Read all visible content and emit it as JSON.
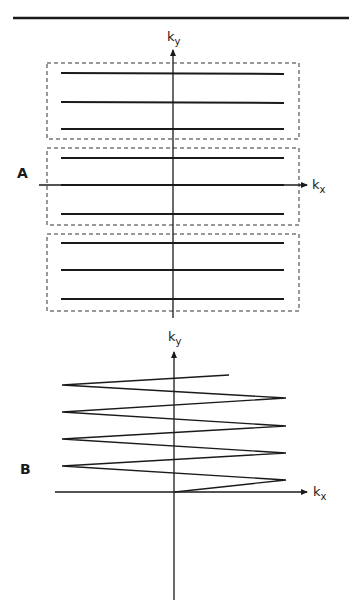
{
  "figure": {
    "top_rule": true,
    "panels": [
      {
        "id": "A",
        "label": "A",
        "x_axis_label": "k",
        "x_axis_sub": "x",
        "y_axis_label": "k",
        "y_axis_sub": "y",
        "description": "Segmented (multi-shot) EPI trajectory: three dashed boxes, each containing three horizontal k-space lines",
        "segments": 3,
        "lines_per_segment": 3
      },
      {
        "id": "B",
        "label": "B",
        "x_axis_label": "k",
        "x_axis_sub": "x",
        "y_axis_label": "k",
        "y_axis_sub": "y",
        "description": "Single-shot zig-zag (blipped-free) EPI trajectory starting at the origin",
        "zigzag_vertices": 9
      }
    ],
    "colors": {
      "ink": "#1a1a1a",
      "background": "#ffffff"
    }
  }
}
